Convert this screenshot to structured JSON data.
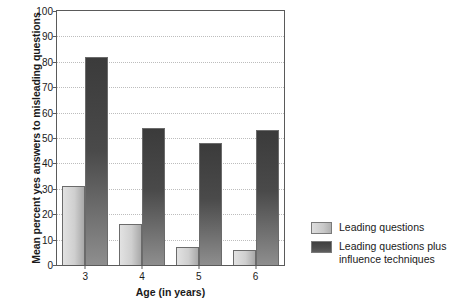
{
  "chart_data": {
    "type": "bar",
    "title": "",
    "xlabel": "Age (in years)",
    "ylabel": "Mean percent yes answers to misleading questions",
    "categories": [
      "3",
      "4",
      "5",
      "6"
    ],
    "ylim": [
      0,
      100
    ],
    "yticks": [
      0,
      10,
      20,
      30,
      40,
      50,
      60,
      70,
      80,
      90,
      100
    ],
    "grid": true,
    "legend_position": "right",
    "series": [
      {
        "name": "Leading questions",
        "color": "#cfcfcf",
        "values": [
          31,
          16,
          7,
          6
        ]
      },
      {
        "name": "Leading questions plus influence techniques",
        "color": "#4a4a4a",
        "values": [
          82,
          54,
          48,
          53
        ]
      }
    ]
  },
  "legend": {
    "items": [
      {
        "label": "Leading questions"
      },
      {
        "label": "Leading questions plus influence techniques"
      }
    ]
  }
}
